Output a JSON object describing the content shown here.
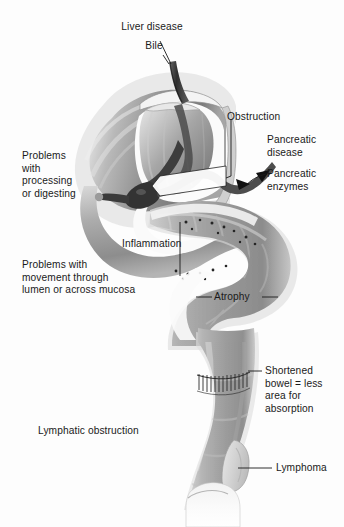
{
  "figure": {
    "kind": "anatomical-diagram",
    "palette": {
      "background": "#fdfdfd",
      "text": "#1a1a1a",
      "leader_line": "#1a1a1a",
      "organ_outline": "#8e8e8e",
      "organ_light": "#e2e2e2",
      "organ_mid": "#a8a8a8",
      "organ_dark": "#6f6f6f",
      "lumen_white": "#f7f7f7",
      "duct_dark": "#3a3a3a",
      "inflammation_dot": "#2b2b2b"
    }
  },
  "labels": {
    "liver_disease": "Liver disease",
    "bile": "Bile",
    "obstruction": "Obstruction",
    "pancreatic_disease_line1": "Pancreatic",
    "pancreatic_disease_line2": "disease",
    "pancreatic_enzymes_line1": "Pancreatic",
    "pancreatic_enzymes_line2": "enzymes",
    "problems_processing_line1": "Problems",
    "problems_processing_line2": "with",
    "problems_processing_line3": "processing",
    "problems_processing_line4": "or digesting",
    "inflammation": "Inflammation",
    "problems_movement_line1": "Problems with",
    "problems_movement_line2": "movement through",
    "problems_movement_line3": "lumen or across mucosa",
    "atrophy": "Atrophy",
    "shortened_bowel_line1": "Shortened",
    "shortened_bowel_line2": "bowel = less",
    "shortened_bowel_line3": "area for",
    "shortened_bowel_line4": "absorption",
    "lymphatic_obstruction": "Lymphatic obstruction",
    "lymphoma": "Lymphoma"
  }
}
